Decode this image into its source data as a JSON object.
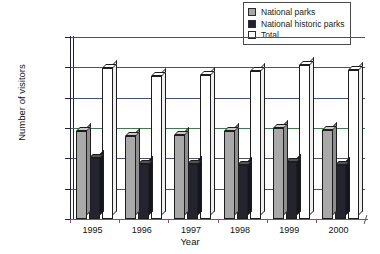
{
  "chart_data": {
    "type": "bar",
    "title": "",
    "xlabel": "Year",
    "ylabel": "Number of visitors",
    "categories": [
      "1995",
      "1996",
      "1997",
      "1998",
      "1999",
      "2000"
    ],
    "series": [
      {
        "name": "National parks",
        "color": "#a9a9a9",
        "values": [
          15200000,
          14400000,
          14500000,
          15100000,
          15700000,
          15300000
        ]
      },
      {
        "name": "National historic parks",
        "color": "#24242f",
        "values": [
          10700000,
          9800000,
          9700000,
          9600000,
          10100000,
          9600000
        ]
      },
      {
        "name": "Total",
        "color": "#ffffff",
        "values": [
          25600000,
          24300000,
          24400000,
          25000000,
          26000000,
          25200000
        ]
      }
    ],
    "ylim": [
      0,
      30000000
    ],
    "ytick_values": [
      0,
      5000000,
      10000000,
      15000000,
      20000000,
      25000000,
      30000000
    ],
    "ytick_labels": [
      "0",
      "5,000,000",
      "10,000,000",
      "15,000,000",
      "20,000,000",
      "25,000,000",
      "30,000,000"
    ],
    "grid": true,
    "legend_position": "top-right"
  },
  "legend": {
    "items": [
      {
        "label": "National parks",
        "swatch": "parks"
      },
      {
        "label": "National historic parks",
        "swatch": "historic"
      },
      {
        "label": "Total",
        "swatch": "total"
      }
    ]
  },
  "axes": {
    "y_title": "Number of visitors",
    "x_title": "Year"
  }
}
